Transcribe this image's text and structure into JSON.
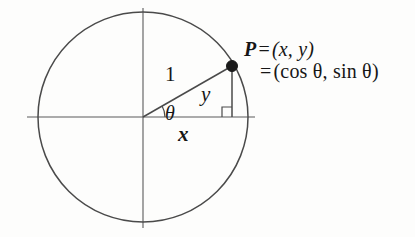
{
  "figure": {
    "type": "unit-circle-diagram",
    "background_color": "#fdfdfc",
    "stroke_color": "#4a4a4a",
    "text_color": "#161616",
    "geometry": {
      "origin_x": 143,
      "origin_y": 117,
      "radius": 105,
      "point_x": 232,
      "point_y": 66,
      "angle_degrees": 30,
      "x_axis_start": 27,
      "x_axis_end": 255,
      "y_axis_top": 8,
      "y_axis_bottom": 228,
      "right_angle_size": 10,
      "arc_radius": 22,
      "dot_radius": 5.5
    },
    "labels": {
      "hypotenuse": "1",
      "angle": "θ",
      "vertical_leg": "y",
      "horizontal_leg": "x",
      "point_line1_name": "P",
      "point_line1_eq": "=",
      "point_line1_value": "(x, y)",
      "point_line2_eq": "=",
      "point_line2_value": "(cos θ, sin θ)"
    }
  }
}
